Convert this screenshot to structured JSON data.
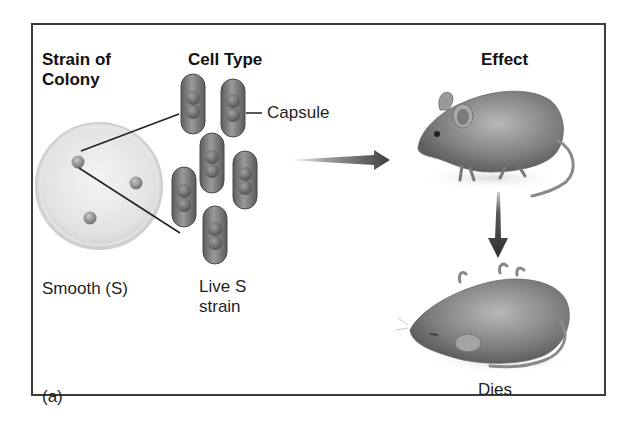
{
  "figure": {
    "panel_label": "(a)",
    "headings": {
      "strain": "Strain of Colony",
      "strain_line1": "Strain of",
      "strain_line2": "Colony",
      "cell_type": "Cell Type",
      "effect": "Effect"
    },
    "labels": {
      "capsule": "Capsule",
      "colony_strain": "Smooth (S)",
      "cell_type_line1": "Live S",
      "cell_type_line2": "strain",
      "outcome": "Dies"
    },
    "elements": {
      "petri_dish": "petri dish with 3 smooth colonies",
      "cells": "6 encapsulated S-strain bacteria (diplococci)",
      "arrow_right": "injection arrow to live mouse",
      "live_mouse": "live mouse",
      "arrow_down": "arrow to dead mouse",
      "dead_mouse": "dead mouse"
    },
    "colors": {
      "border": "#3c3c3c",
      "text": "#1a1a1a",
      "cell_fill": "#8a8a8a",
      "arrow": "#4a4a4a"
    }
  }
}
